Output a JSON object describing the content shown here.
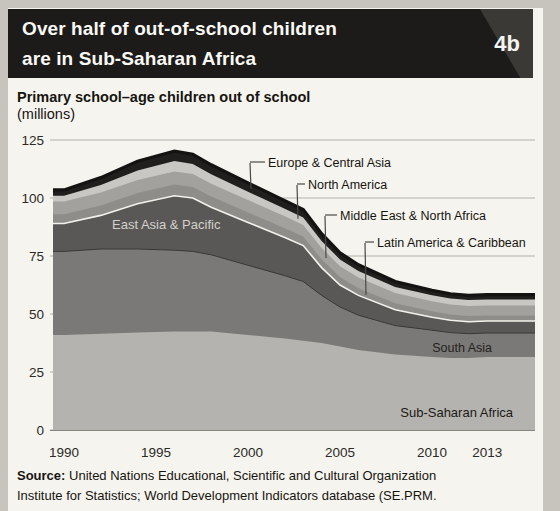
{
  "header": {
    "title_line1": "Over half of out-of-school children",
    "title_line2": "are in Sub-Saharan Africa",
    "figure_number": "4b"
  },
  "subtitle": {
    "text": "Primary school–age children out of school",
    "unit": "(millions)"
  },
  "source": {
    "label": "Source:",
    "line1": " United Nations Educational, Scientific and Cultural Organization",
    "line2": "Institute for Statistics; World Development Indicators database (SE.PRM."
  },
  "chart_data": {
    "type": "area",
    "stacked": true,
    "title": "Primary school–age children out of school (millions)",
    "xlabel": "",
    "ylabel": "millions",
    "ylim": [
      0,
      125
    ],
    "yticks": [
      "0",
      "25",
      "50",
      "75",
      "100",
      "125"
    ],
    "ytick_values": [
      0,
      25,
      50,
      75,
      100,
      125
    ],
    "xticks": [
      "1990",
      "1995",
      "2000",
      "2005",
      "2010",
      "2013"
    ],
    "xtick_values": [
      1990,
      1995,
      2000,
      2005,
      2010,
      2013
    ],
    "grid": true,
    "legend_position": "annotated-on-chart",
    "years": [
      1990,
      1992,
      1994,
      1996,
      1997,
      1998,
      2000,
      2002,
      2003,
      2004,
      2005,
      2006,
      2008,
      2010,
      2011,
      2012,
      2013
    ],
    "series": [
      {
        "name": "Sub-Saharan Africa",
        "color": "#b5b3af",
        "values": [
          41,
          41.5,
          42,
          42.5,
          42.5,
          42.5,
          41,
          39.5,
          38.5,
          37.5,
          36,
          34.5,
          32.5,
          31.5,
          31,
          31,
          31.5
        ]
      },
      {
        "name": "South Asia",
        "color": "#7b7977",
        "values": [
          36,
          36.5,
          36,
          35,
          34.5,
          33,
          30,
          27,
          25.5,
          20.5,
          17,
          15,
          12.5,
          11.5,
          11,
          10.5,
          10.3
        ]
      },
      {
        "name": "East Asia & Pacific",
        "color": "#5a5856",
        "values": [
          12,
          14.5,
          19.5,
          23.5,
          23,
          20.5,
          18.5,
          16.5,
          15.5,
          12,
          9.5,
          8.5,
          6.8,
          5.6,
          5.3,
          5.2,
          5.2
        ]
      },
      {
        "name": "Latin America & Caribbean",
        "color": "#8f8d8a",
        "values": [
          4,
          4.3,
          4.6,
          4.8,
          4.7,
          4.6,
          4.3,
          4,
          3.9,
          3.6,
          3.4,
          3.1,
          2.8,
          2.6,
          2.5,
          2.4,
          2.3
        ]
      },
      {
        "name": "Middle East & North Africa",
        "color": "#a3a19d",
        "values": [
          5.5,
          5.6,
          5.7,
          5.6,
          5.6,
          5.5,
          5.3,
          5.1,
          5,
          4.9,
          4.7,
          4.6,
          4.4,
          4.3,
          4.3,
          4.3,
          4.3
        ]
      },
      {
        "name": "North America",
        "color": "#c9c7c3",
        "values": [
          2.5,
          3.2,
          4,
          4.5,
          4.4,
          4.1,
          3.6,
          3.3,
          3.2,
          3,
          2.9,
          2.8,
          2.6,
          2.6,
          2.6,
          2.6,
          2.6
        ]
      },
      {
        "name": "Europe & Central Asia",
        "color": "#201f1d",
        "values": [
          2.5,
          3.2,
          4,
          4.3,
          4.2,
          4.1,
          3.8,
          3.5,
          3.4,
          3.1,
          2.9,
          2.7,
          2.4,
          2.1,
          2,
          2,
          2.1
        ]
      }
    ],
    "annotations": [
      {
        "label": "Europe & Central Asia",
        "series_index": 6,
        "text_x": 268,
        "text_cy": 162,
        "target_x": 251
      },
      {
        "label": "North America",
        "series_index": 5,
        "text_x": 308,
        "text_cy": 184,
        "target_x": 298
      },
      {
        "label": "Middle East & North Africa",
        "series_index": 4,
        "text_x": 340,
        "text_cy": 215,
        "target_x": 326
      },
      {
        "label": "Latin America & Caribbean",
        "series_index": 3,
        "text_x": 377,
        "text_cy": 242,
        "target_x": 366
      }
    ],
    "inner_labels": [
      {
        "text": "East Asia & Pacific",
        "x": 112,
        "y": 229,
        "anchor": "start",
        "color": "#d3d1cd",
        "size": 13
      },
      {
        "text": "South Asia",
        "x": 492,
        "y": 352,
        "anchor": "end",
        "color": "#24221e",
        "size": 12.5
      },
      {
        "text": "Sub-Saharan Africa",
        "x": 513,
        "y": 417,
        "anchor": "end",
        "color": "#1c1a16",
        "size": 13
      }
    ],
    "style": {
      "grid_color": "#b2b0ab",
      "axis_text_color": "#2b2a27",
      "top_stroke": "#141311",
      "white_separator": "#f3f1ec",
      "dark_separator": "#3a3836",
      "leader_color": "#4a4846",
      "annotation_text_color": "#16140f"
    }
  }
}
